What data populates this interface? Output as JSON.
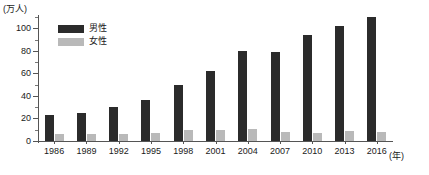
{
  "chart_data": {
    "type": "bar",
    "title": "",
    "subtitle": "",
    "xlabel": "(年)",
    "ylabel": "(万人)",
    "ylim": [
      0,
      110
    ],
    "ytick_step": 20,
    "yticks": [
      0,
      20,
      40,
      60,
      80,
      100
    ],
    "ytick_labels": [
      "0",
      "20",
      "40",
      "60",
      "80",
      "100"
    ],
    "minor_ticks": true,
    "grid": false,
    "legend_position": "top-left",
    "categories": [
      "1986",
      "1989",
      "1992",
      "1995",
      "1998",
      "2001",
      "2004",
      "2007",
      "2010",
      "2013",
      "2016"
    ],
    "series": [
      {
        "name": "男性",
        "color": "#2b2b2b",
        "values": [
          23,
          25,
          30,
          36,
          50,
          62,
          80,
          79,
          94,
          102,
          110
        ]
      },
      {
        "name": "女性",
        "color": "#b9b9b9",
        "values": [
          6,
          6,
          6,
          7,
          10,
          10,
          11,
          8,
          7,
          9,
          8
        ]
      }
    ]
  },
  "axes": {
    "y_unit_label": "(万人)",
    "x_unit_label": "(年)"
  },
  "legend": {
    "items": [
      {
        "label": "男性",
        "color": "#2b2b2b",
        "swatch": "legend-swatch-male"
      },
      {
        "label": "女性",
        "color": "#b9b9b9",
        "swatch": "legend-swatch-female"
      }
    ]
  }
}
